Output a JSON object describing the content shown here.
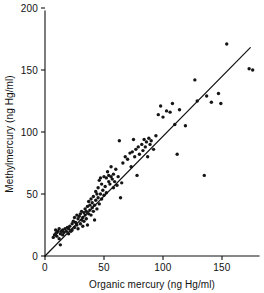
{
  "chart_data": {
    "type": "scatter",
    "title": "",
    "xlabel": "Organic mercury (ng Hg/ml)",
    "ylabel": "Methylmercury (ng Hg/ml)",
    "xlim": [
      0,
      180
    ],
    "ylim": [
      0,
      200
    ],
    "xticks": [
      0,
      50,
      100,
      150
    ],
    "yticks": [
      0,
      50,
      100,
      150,
      200
    ],
    "xticklabels": [
      "0",
      "50",
      "100",
      "150"
    ],
    "yticklabels": [
      "0",
      "50",
      "100",
      "150",
      "200"
    ],
    "grid": false,
    "legend": null,
    "units": "ng Hg/ml",
    "series": [
      {
        "name": "samples",
        "marker": "filled-circle",
        "color": "#151515",
        "points": [
          [
            7,
            15
          ],
          [
            8,
            17
          ],
          [
            9,
            18
          ],
          [
            9,
            21
          ],
          [
            10,
            16
          ],
          [
            10,
            19
          ],
          [
            11,
            20
          ],
          [
            12,
            14
          ],
          [
            12,
            22
          ],
          [
            13,
            9
          ],
          [
            13,
            18
          ],
          [
            14,
            20
          ],
          [
            15,
            17
          ],
          [
            15,
            21
          ],
          [
            16,
            19
          ],
          [
            17,
            22
          ],
          [
            18,
            20
          ],
          [
            19,
            23
          ],
          [
            20,
            18
          ],
          [
            20,
            22
          ],
          [
            21,
            24
          ],
          [
            22,
            20
          ],
          [
            23,
            26
          ],
          [
            23,
            21
          ],
          [
            24,
            28
          ],
          [
            25,
            23
          ],
          [
            25,
            31
          ],
          [
            26,
            27
          ],
          [
            27,
            25
          ],
          [
            27,
            33
          ],
          [
            28,
            22
          ],
          [
            28,
            30
          ],
          [
            29,
            32
          ],
          [
            30,
            26
          ],
          [
            30,
            34
          ],
          [
            31,
            29
          ],
          [
            31,
            36
          ],
          [
            32,
            24
          ],
          [
            32,
            31
          ],
          [
            33,
            35
          ],
          [
            33,
            28
          ],
          [
            34,
            33
          ],
          [
            34,
            38
          ],
          [
            35,
            30
          ],
          [
            35,
            36
          ],
          [
            36,
            25
          ],
          [
            36,
            40
          ],
          [
            37,
            34
          ],
          [
            37,
            44
          ],
          [
            38,
            37
          ],
          [
            38,
            41
          ],
          [
            39,
            33
          ],
          [
            39,
            46
          ],
          [
            40,
            39
          ],
          [
            40,
            43
          ],
          [
            41,
            36
          ],
          [
            41,
            48
          ],
          [
            42,
            41
          ],
          [
            42,
            29
          ],
          [
            43,
            45
          ],
          [
            43,
            52
          ],
          [
            44,
            38
          ],
          [
            44,
            50
          ],
          [
            45,
            47
          ],
          [
            45,
            55
          ],
          [
            46,
            42
          ],
          [
            46,
            61
          ],
          [
            47,
            50
          ],
          [
            47,
            63
          ],
          [
            48,
            46
          ],
          [
            48,
            58
          ],
          [
            49,
            53
          ],
          [
            50,
            49
          ],
          [
            50,
            64
          ],
          [
            51,
            56
          ],
          [
            52,
            63
          ],
          [
            52,
            51
          ],
          [
            53,
            68
          ],
          [
            54,
            60
          ],
          [
            54,
            65
          ],
          [
            55,
            58
          ],
          [
            56,
            64
          ],
          [
            56,
            72
          ],
          [
            57,
            62
          ],
          [
            58,
            55
          ],
          [
            58,
            66
          ],
          [
            59,
            60
          ],
          [
            60,
            70
          ],
          [
            61,
            57
          ],
          [
            62,
            64
          ],
          [
            63,
            93
          ],
          [
            64,
            47
          ],
          [
            65,
            59
          ],
          [
            66,
            75
          ],
          [
            68,
            80
          ],
          [
            70,
            78
          ],
          [
            72,
            83
          ],
          [
            73,
            72
          ],
          [
            74,
            84
          ],
          [
            75,
            94
          ],
          [
            76,
            80
          ],
          [
            77,
            86
          ],
          [
            78,
            65
          ],
          [
            79,
            88
          ],
          [
            80,
            82
          ],
          [
            82,
            90
          ],
          [
            83,
            85
          ],
          [
            84,
            94
          ],
          [
            85,
            88
          ],
          [
            86,
            92
          ],
          [
            87,
            80
          ],
          [
            88,
            95
          ],
          [
            89,
            90
          ],
          [
            90,
            93
          ],
          [
            92,
            86
          ],
          [
            94,
            97
          ],
          [
            96,
            114
          ],
          [
            98,
            121
          ],
          [
            100,
            112
          ],
          [
            103,
            117
          ],
          [
            106,
            116
          ],
          [
            108,
            123
          ],
          [
            110,
            106
          ],
          [
            112,
            82
          ],
          [
            114,
            118
          ],
          [
            119,
            105
          ],
          [
            127,
            142
          ],
          [
            129,
            125
          ],
          [
            135,
            65
          ],
          [
            137,
            129
          ],
          [
            141,
            124
          ],
          [
            147,
            131
          ],
          [
            149,
            123
          ],
          [
            154,
            171
          ],
          [
            173,
            151
          ],
          [
            176,
            150
          ]
        ]
      }
    ],
    "fit_line": {
      "type": "linear-regression",
      "x_start": 0,
      "y_start": 0,
      "x_end": 174,
      "y_end": 168
    }
  },
  "axes": {
    "x_title": "Organic mercury (ng Hg/ml)",
    "y_title": "Methylmercury (ng Hg/ml)"
  }
}
